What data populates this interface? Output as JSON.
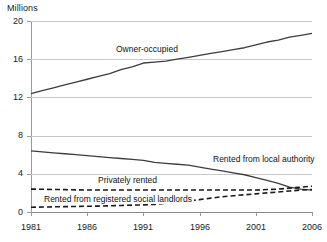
{
  "chart_data": {
    "type": "line",
    "title": "",
    "subtitle": "",
    "xlabel": "",
    "ylabel": "Millions",
    "unit_label": "Millions",
    "xlim": [
      1981,
      2006
    ],
    "ylim": [
      0,
      20
    ],
    "yticks": [
      0,
      4,
      8,
      12,
      16,
      20
    ],
    "ytick_labels": [
      "0",
      "4",
      "8",
      "12",
      "16",
      "20"
    ],
    "xticks": [
      1981,
      1986,
      1991,
      1996,
      2001,
      2006
    ],
    "xtick_labels": [
      "1981",
      "1986",
      "1991",
      "1996",
      "2001",
      "2006"
    ],
    "grid": "horizontal",
    "legend_position": "inline-labels",
    "x": [
      1981,
      1982,
      1983,
      1984,
      1985,
      1986,
      1987,
      1988,
      1989,
      1990,
      1991,
      1992,
      1993,
      1994,
      1995,
      1996,
      1997,
      1998,
      1999,
      2000,
      2001,
      2002,
      2003,
      2004,
      2005,
      2006
    ],
    "series": [
      {
        "name": "Owner-occupied",
        "style": "solid",
        "color": "#3d3d3d",
        "label_x": 1988.4,
        "label_y": 17.0,
        "values": [
          12.4,
          12.7,
          13.0,
          13.3,
          13.6,
          13.9,
          14.2,
          14.5,
          14.9,
          15.2,
          15.6,
          15.7,
          15.8,
          16.0,
          16.2,
          16.4,
          16.6,
          16.8,
          17.0,
          17.2,
          17.5,
          17.8,
          18.0,
          18.3,
          18.5,
          18.7
        ]
      },
      {
        "name": "Rented from local authority",
        "style": "solid",
        "color": "#3d3d3d",
        "label_x": 1997.0,
        "label_y": 5.4,
        "values": [
          6.4,
          6.3,
          6.2,
          6.1,
          6.0,
          5.9,
          5.8,
          5.7,
          5.6,
          5.5,
          5.4,
          5.2,
          5.1,
          5.0,
          4.9,
          4.7,
          4.5,
          4.3,
          4.1,
          3.9,
          3.6,
          3.3,
          3.0,
          2.6,
          2.4,
          2.3
        ]
      },
      {
        "name": "Privately rented",
        "style": "dashed",
        "color": "#1a1a1a",
        "label_x": 1986.8,
        "label_y": 3.2,
        "values": [
          2.4,
          2.38,
          2.36,
          2.34,
          2.32,
          2.3,
          2.3,
          2.3,
          2.3,
          2.3,
          2.3,
          2.3,
          2.3,
          2.3,
          2.3,
          2.3,
          2.3,
          2.3,
          2.3,
          2.3,
          2.3,
          2.35,
          2.4,
          2.5,
          2.6,
          2.7
        ]
      },
      {
        "name": "Rented from registered social landlords",
        "style": "dashed",
        "color": "#1a1a1a",
        "label_x": 1982.0,
        "label_y": 1.3,
        "values": [
          0.5,
          0.52,
          0.54,
          0.56,
          0.58,
          0.6,
          0.62,
          0.65,
          0.68,
          0.72,
          0.75,
          0.8,
          0.9,
          1.0,
          1.15,
          1.3,
          1.45,
          1.6,
          1.7,
          1.8,
          1.9,
          2.0,
          2.1,
          2.2,
          2.3,
          2.35
        ]
      }
    ]
  }
}
